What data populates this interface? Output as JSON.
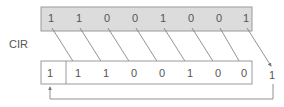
{
  "diagram": {
    "label": "CIR",
    "top_register": {
      "bits": [
        "1",
        "1",
        "0",
        "0",
        "1",
        "0",
        "0",
        "1"
      ],
      "fill": "#dcdcdc"
    },
    "bottom_register": {
      "carry_bit": "1",
      "bits": [
        "1",
        "1",
        "0",
        "0",
        "1",
        "0",
        "0"
      ],
      "shifted_out_bit": "1",
      "fill": "#ffffff"
    },
    "colors": {
      "border": "#9a9a9a",
      "arrow": "#777777",
      "text": "#555555"
    }
  }
}
